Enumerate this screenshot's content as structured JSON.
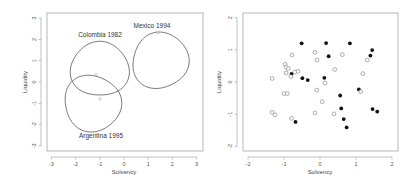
{
  "chart_data": [
    {
      "type": "line",
      "title": "",
      "xlabel": "Solvency",
      "ylabel": "Liquidity",
      "xlim": [
        -3,
        3
      ],
      "ylim": [
        -3,
        3
      ],
      "xticks": [
        -3,
        -2,
        -1,
        0,
        1,
        2,
        3
      ],
      "yticks": [
        -3,
        -2,
        -1,
        0,
        1,
        2,
        3
      ],
      "grid": false,
      "series": [
        {
          "name": "Colombia 1982",
          "shape": "closed curve",
          "center": [
            -1.0,
            0.6
          ],
          "radius": [
            1.18,
            1.3
          ],
          "marker": [
            -1.0,
            -0.8
          ]
        },
        {
          "name": "Mexico 1994",
          "shape": "closed curve",
          "center": [
            1.5,
            1.0
          ],
          "radius": [
            1.17,
            1.3
          ],
          "marker": [
            1.4,
            2.3
          ]
        },
        {
          "name": "Argentina 1995",
          "shape": "closed curve",
          "center": [
            -1.3,
            -1.0
          ],
          "radius": [
            1.19,
            1.3
          ],
          "marker": [
            -1.15,
            0.35
          ]
        }
      ]
    },
    {
      "type": "scatter",
      "title": "",
      "xlabel": "Solvency",
      "ylabel": "Liquidity",
      "xlim": [
        -2,
        2
      ],
      "ylim": [
        -2,
        2
      ],
      "xticks": [
        -2,
        -1,
        0,
        1,
        2
      ],
      "yticks": [
        -2,
        -1,
        0,
        1,
        2
      ],
      "grid": false,
      "series": [
        {
          "name": "filled",
          "marker": "filled-circle",
          "points": [
            [
              -0.51,
              1.2
            ],
            [
              0.17,
              1.21
            ],
            [
              0.83,
              1.2
            ],
            [
              1.45,
              0.99
            ],
            [
              1.4,
              0.82
            ],
            [
              0.24,
              0.8
            ],
            [
              -0.79,
              0.25
            ],
            [
              -0.49,
              0.12
            ],
            [
              -0.34,
              0.06
            ],
            [
              0.12,
              0.13
            ],
            [
              1.08,
              -0.23
            ],
            [
              0.56,
              -0.42
            ],
            [
              0.59,
              -0.82
            ],
            [
              1.46,
              -0.84
            ],
            [
              1.59,
              -0.92
            ],
            [
              0.66,
              -1.15
            ],
            [
              -0.68,
              -1.24
            ],
            [
              0.74,
              -1.41
            ]
          ]
        },
        {
          "name": "open",
          "marker": "open-circle",
          "points": [
            [
              -0.78,
              0.84
            ],
            [
              -0.14,
              0.92
            ],
            [
              0.62,
              0.85
            ],
            [
              -0.08,
              0.68
            ],
            [
              1.31,
              0.68
            ],
            [
              -0.97,
              0.55
            ],
            [
              -0.94,
              0.46
            ],
            [
              -0.88,
              0.42
            ],
            [
              -0.94,
              0.28
            ],
            [
              -0.7,
              0.31
            ],
            [
              -0.61,
              0.33
            ],
            [
              0.41,
              0.39
            ],
            [
              1.19,
              0.26
            ],
            [
              -0.81,
              0.17
            ],
            [
              -1.33,
              0.11
            ],
            [
              0.14,
              -0.03
            ],
            [
              -0.09,
              -0.25
            ],
            [
              1.13,
              -0.3
            ],
            [
              -1.0,
              -0.36
            ],
            [
              -0.91,
              -0.36
            ],
            [
              0.06,
              -0.61
            ],
            [
              -1.33,
              -0.94
            ],
            [
              -1.25,
              -1.02
            ],
            [
              -0.14,
              -0.96
            ],
            [
              0.39,
              -0.99
            ],
            [
              -0.79,
              -1.13
            ]
          ]
        }
      ]
    }
  ],
  "panels": {
    "left": {
      "xlabel": "Solvency",
      "ylabel": "Liquidity",
      "xticks": [
        "-3",
        "-2",
        "-1",
        "0",
        "1",
        "2",
        "3"
      ],
      "yticks": [
        "-3",
        "-2",
        "-1",
        "0",
        "1",
        "2",
        "3"
      ],
      "labels": {
        "colombia": "Colombia 1982",
        "mexico": "Mexico 1994",
        "argentina": "Argentina 1995"
      }
    },
    "right": {
      "xlabel": "Solvency",
      "ylabel": "Liquidity",
      "xticks": [
        "-2",
        "-1",
        "0",
        "1",
        "2"
      ],
      "yticks": [
        "-2",
        "-1",
        "0",
        "1",
        "2"
      ]
    }
  },
  "colors": {
    "curve": "#555555",
    "filled_point": "#111111",
    "open_point": "#777777",
    "frame": "#999999"
  }
}
